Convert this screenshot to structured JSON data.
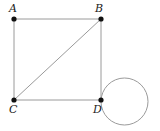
{
  "figure": {
    "background_color": "#ffffff",
    "line_color": "#9a9a9a",
    "point_color": "#111111",
    "label_color": "#1a1a1a",
    "width": 160,
    "height": 131
  },
  "points": [
    {
      "id": "A",
      "label": "A",
      "x": 14,
      "y": 19,
      "label_x": 9,
      "label_y": 3
    },
    {
      "id": "B",
      "label": "B",
      "x": 101,
      "y": 19,
      "label_x": 95,
      "label_y": 3
    },
    {
      "id": "C",
      "label": "C",
      "x": 14,
      "y": 100,
      "label_x": 9,
      "label_y": 104
    },
    {
      "id": "D",
      "label": "D",
      "x": 101,
      "y": 100,
      "label_x": 93,
      "label_y": 104
    }
  ],
  "segments": [
    {
      "id": "AB",
      "from": "A",
      "to": "B",
      "x1": 14,
      "y1": 19,
      "x2": 101,
      "y2": 19
    },
    {
      "id": "AC",
      "from": "A",
      "to": "C",
      "x1": 14,
      "y1": 19,
      "x2": 14,
      "y2": 100
    },
    {
      "id": "BD",
      "from": "B",
      "to": "D",
      "x1": 101,
      "y1": 19,
      "x2": 101,
      "y2": 100
    },
    {
      "id": "CD",
      "from": "C",
      "to": "D",
      "x1": 14,
      "y1": 100,
      "x2": 101,
      "y2": 100
    },
    {
      "id": "CB",
      "from": "C",
      "to": "B",
      "x1": 14,
      "y1": 100,
      "x2": 101,
      "y2": 19
    }
  ],
  "circle": {
    "id": "circle-at-D",
    "cx": 124.5,
    "cy": 101.5,
    "r": 23.5
  },
  "style": {
    "stroke_width": 1,
    "point_radius": 2.6,
    "label_font_size": 11
  }
}
